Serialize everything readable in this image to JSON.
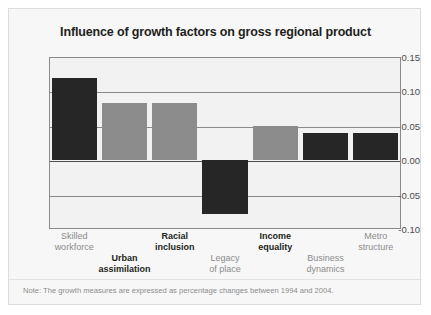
{
  "card": {
    "background": "#f7f7f7",
    "border_color": "#dcdcdc"
  },
  "chart_data": {
    "type": "bar",
    "title": "Influence of growth factors on gross regional product",
    "xlabel": "",
    "ylabel": "",
    "ylim": [
      -0.1,
      0.15
    ],
    "yticks": [
      "0.15",
      "0.10",
      "0.05",
      "0.00",
      "-0.05",
      "-0.10"
    ],
    "ytick_values": [
      0.15,
      0.1,
      0.05,
      0.0,
      -0.05,
      -0.1
    ],
    "grid": true,
    "legend": "none",
    "categories": [
      "Skilled workforce",
      "Urban assimilation",
      "Racial inclusion",
      "Legacy of place",
      "Income equality",
      "Business dynamics",
      "Metro structure"
    ],
    "values": [
      0.12,
      0.083,
      0.083,
      -0.078,
      0.05,
      0.04,
      0.04
    ],
    "bar_colors": [
      "#262626",
      "#8c8c8c",
      "#8c8c8c",
      "#262626",
      "#8c8c8c",
      "#262626",
      "#262626"
    ],
    "label_emphasis": [
      false,
      true,
      true,
      false,
      true,
      false,
      false
    ],
    "label_row": [
      "top",
      "bottom",
      "top",
      "bottom",
      "top",
      "bottom",
      "top"
    ],
    "note": "Note: The growth measures are expressed as percentage changes between 1994 and 2004.",
    "colors": {
      "dark": "#262626",
      "gray": "#8c8c8c",
      "plot_background": "#f2f2f2",
      "axis": "#8a8a8a",
      "zero_axis": "#4d4d4d",
      "label_dark": "#231f20",
      "label_gray": "#8c8c8c"
    }
  }
}
